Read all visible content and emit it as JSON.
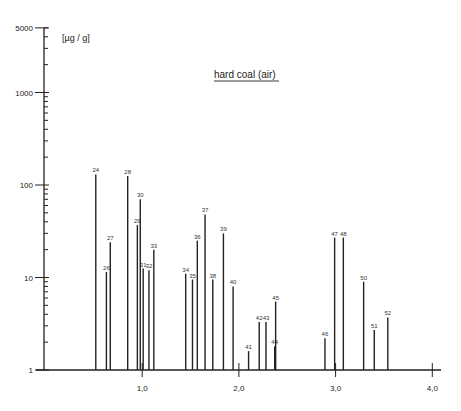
{
  "chart_data": {
    "type": "bar",
    "subtype": "stick-spectrum",
    "title": "hard coal (air)",
    "unit_label": "[µg / g]",
    "xlabel": "",
    "ylabel": "µg/g",
    "yscale": "log",
    "ylim": [
      1,
      5000
    ],
    "xlim": [
      0,
      4.1
    ],
    "y_tick_labels": [
      {
        "value": 1,
        "label": "1"
      },
      {
        "value": 10,
        "label": "10"
      },
      {
        "value": 100,
        "label": "100"
      },
      {
        "value": 1000,
        "label": "1000"
      },
      {
        "value": 5000,
        "label": "5000"
      }
    ],
    "x_tick_labels": [
      {
        "value": 1.0,
        "label": "1,0"
      },
      {
        "value": 2.0,
        "label": "2,0"
      },
      {
        "value": 3.0,
        "label": "3,0"
      },
      {
        "value": 4.0,
        "label": "4,0"
      }
    ],
    "grid": false,
    "peaks": [
      {
        "label": "24",
        "x": 0.52,
        "value": 130
      },
      {
        "label": "26",
        "x": 0.63,
        "value": 11.5
      },
      {
        "label": "27",
        "x": 0.67,
        "value": 24
      },
      {
        "label": "28",
        "x": 0.85,
        "value": 125
      },
      {
        "label": "29",
        "x": 0.95,
        "value": 37
      },
      {
        "label": "30",
        "x": 0.98,
        "value": 70
      },
      {
        "label": "31",
        "x": 1.01,
        "value": 12.5
      },
      {
        "label": "32",
        "x": 1.07,
        "value": 12
      },
      {
        "label": "33",
        "x": 1.12,
        "value": 20
      },
      {
        "label": "34",
        "x": 1.45,
        "value": 11
      },
      {
        "label": "35",
        "x": 1.52,
        "value": 9.5
      },
      {
        "label": "36",
        "x": 1.57,
        "value": 25
      },
      {
        "label": "37",
        "x": 1.65,
        "value": 48
      },
      {
        "label": "38",
        "x": 1.73,
        "value": 9.5
      },
      {
        "label": "39",
        "x": 1.84,
        "value": 30
      },
      {
        "label": "40",
        "x": 1.94,
        "value": 8
      },
      {
        "label": "41",
        "x": 2.1,
        "value": 1.6
      },
      {
        "label": "42",
        "x": 2.21,
        "value": 3.3
      },
      {
        "label": "43",
        "x": 2.28,
        "value": 3.3
      },
      {
        "label": "44",
        "x": 2.37,
        "value": 1.8
      },
      {
        "label": "45",
        "x": 2.38,
        "value": 5.5
      },
      {
        "label": "46",
        "x": 2.89,
        "value": 2.2
      },
      {
        "label": "47",
        "x": 2.99,
        "value": 27
      },
      {
        "label": "48",
        "x": 3.08,
        "value": 27
      },
      {
        "label": "50",
        "x": 3.29,
        "value": 9
      },
      {
        "label": "51",
        "x": 3.4,
        "value": 2.7
      },
      {
        "label": "52",
        "x": 3.54,
        "value": 3.7
      }
    ]
  }
}
